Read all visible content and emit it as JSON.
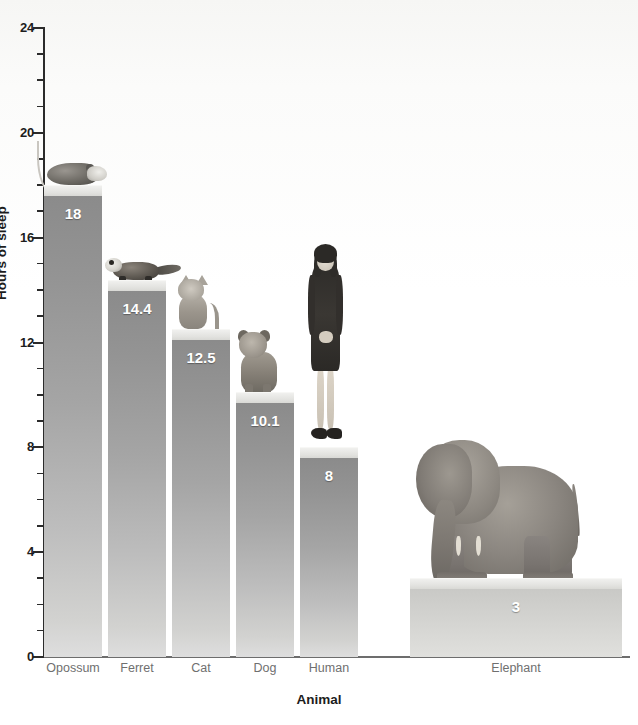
{
  "chart_data": {
    "type": "bar",
    "title": "",
    "subtitle": "",
    "xlabel": "Animal",
    "ylabel": "Hours of sleep",
    "ylim": [
      0,
      24
    ],
    "ytick_values": [
      0,
      4,
      8,
      12,
      16,
      20,
      24
    ],
    "ytick_labels": [
      "0",
      "4",
      "8",
      "12",
      "16",
      "20",
      "24"
    ],
    "minor_tick_interval": 1,
    "grid": false,
    "legend": false,
    "categories": [
      "Opossum",
      "Ferret",
      "Cat",
      "Dog",
      "Human",
      "Elephant"
    ],
    "values": [
      18,
      14.4,
      12.5,
      10.1,
      8,
      3
    ],
    "value_labels": [
      "18",
      "14.4",
      "12.5",
      "10.1",
      "8",
      "3"
    ],
    "bar_color": "#9a9a9a",
    "bar_top_color": "#e2e2df",
    "label_color": "#ffffff",
    "axis_color": "#2b2b2b",
    "background_color": "#ffffff",
    "annotations": [
      "Each bar is topped by a photographic pedestal showing the animal.",
      "Opossum sleeps the most at 18 hours; Elephant sleeps the least at 3 hours."
    ]
  },
  "bars": [
    {
      "label": "Opossum",
      "value": 18,
      "value_label": "18",
      "icon": "opossum-image"
    },
    {
      "label": "Ferret",
      "value": 14.4,
      "value_label": "14.4",
      "icon": "ferret-image"
    },
    {
      "label": "Cat",
      "value": 12.5,
      "value_label": "12.5",
      "icon": "cat-image"
    },
    {
      "label": "Dog",
      "value": 10.1,
      "value_label": "10.1",
      "icon": "dog-image"
    },
    {
      "label": "Human",
      "value": 8,
      "value_label": "8",
      "icon": "human-image"
    },
    {
      "label": "Elephant",
      "value": 3,
      "value_label": "3",
      "icon": "elephant-image"
    }
  ],
  "axes": {
    "y_title": "Hours of sleep",
    "x_title": "Animal",
    "y_labels": [
      "24",
      "20",
      "16",
      "12",
      "8",
      "4",
      "0"
    ]
  }
}
